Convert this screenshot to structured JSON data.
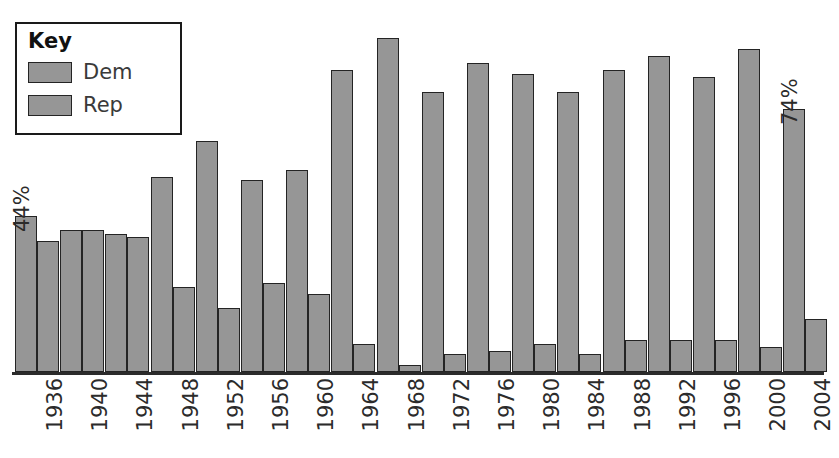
{
  "chart_data": {
    "type": "bar",
    "title": "",
    "xlabel": "",
    "ylabel": "",
    "ylim": [
      0,
      100
    ],
    "grid": false,
    "legend_position": "top-left",
    "categories": [
      "1936",
      "1940",
      "1944",
      "1948",
      "1952",
      "1956",
      "1960",
      "1964",
      "1968",
      "1972",
      "1976",
      "1980",
      "1984",
      "1988",
      "1992",
      "1996",
      "2000",
      "2004"
    ],
    "series": [
      {
        "name": "Dem",
        "color": "#969696",
        "values": [
          44,
          40,
          39,
          55,
          65,
          54,
          57,
          85,
          94,
          79,
          87,
          84,
          79,
          85,
          89,
          83,
          91,
          74
        ]
      },
      {
        "name": "Rep",
        "color": "#969696",
        "values": [
          37,
          40,
          38,
          24,
          18,
          25,
          22,
          8,
          2,
          5,
          6,
          8,
          5,
          9,
          9,
          9,
          7,
          15
        ]
      }
    ],
    "annotations": [
      {
        "text": "44%",
        "series": "Dem",
        "category": "1936"
      },
      {
        "text": "74%",
        "series": "Dem",
        "category": "2004"
      }
    ]
  },
  "legend": {
    "title": "Key",
    "entries": [
      {
        "label": "Dem"
      },
      {
        "label": "Rep"
      }
    ]
  }
}
